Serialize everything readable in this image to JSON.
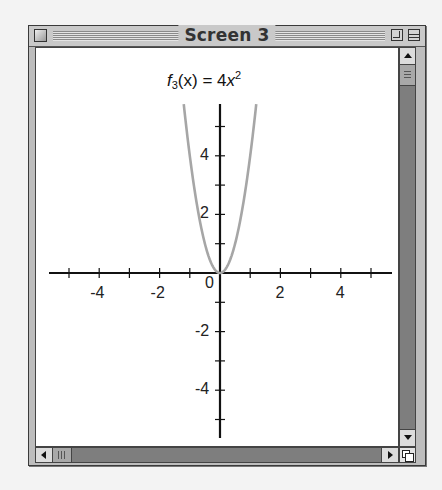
{
  "window": {
    "title": "Screen 3",
    "controls": {
      "close": "close-box",
      "zoom": "zoom-box",
      "collapse": "collapse-box"
    }
  },
  "chart_data": {
    "type": "line",
    "title_parts": {
      "func": "f",
      "subscript": "3",
      "arg": "(x)",
      "equals": " = ",
      "coef": "4",
      "var": "x",
      "exponent": "2"
    },
    "xlabel": "",
    "ylabel": "",
    "xlim": [
      -5.7,
      5.7
    ],
    "ylim": [
      -5.7,
      5.7
    ],
    "x_ticks": [
      -5,
      -4,
      -3,
      -2,
      -1,
      1,
      2,
      3,
      4,
      5
    ],
    "x_tick_labels": [
      {
        "value": -4,
        "label": "-4"
      },
      {
        "value": -2,
        "label": "-2"
      },
      {
        "value": 0,
        "label": "0"
      },
      {
        "value": 2,
        "label": "2"
      },
      {
        "value": 4,
        "label": "4"
      }
    ],
    "y_ticks": [
      -5,
      -4,
      -3,
      -2,
      -1,
      1,
      2,
      3,
      4,
      5
    ],
    "y_tick_labels": [
      {
        "value": 4,
        "label": "4"
      },
      {
        "value": 2,
        "label": "2"
      },
      {
        "value": -2,
        "label": "-2"
      },
      {
        "value": -4,
        "label": "-4"
      }
    ],
    "grid": false,
    "series": [
      {
        "name": "f_3(x) = 4x^2",
        "color": "#a6a6a6",
        "x": [
          -1.2,
          -1.0,
          -0.8,
          -0.6,
          -0.4,
          -0.2,
          0,
          0.2,
          0.4,
          0.6,
          0.8,
          1.0,
          1.2
        ],
        "y": [
          5.76,
          4.0,
          2.56,
          1.44,
          0.64,
          0.16,
          0,
          0.16,
          0.64,
          1.44,
          2.56,
          4.0,
          5.76
        ]
      }
    ],
    "axis_color": "#111111"
  }
}
